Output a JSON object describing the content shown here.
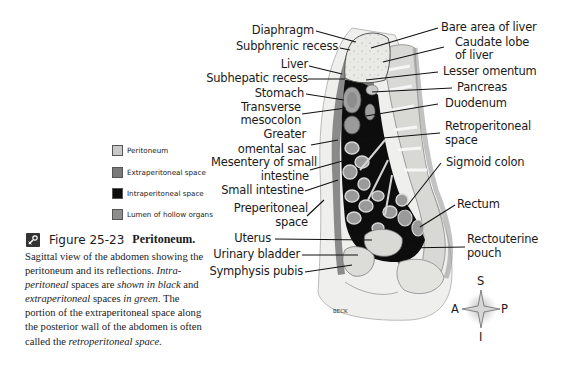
{
  "legend": {
    "items": [
      {
        "label": "Peritoneum",
        "color": "#c8c8c8"
      },
      {
        "label": "Extraperitoneal space",
        "color": "#7a7a7a"
      },
      {
        "label": "Intraperitoneal space",
        "color": "#0d0d0d"
      },
      {
        "label": "Lumen of hollow organs",
        "color": "#8d8d8d"
      }
    ]
  },
  "figure": {
    "icon": "interactive-link-icon",
    "number": "Figure 25-23",
    "title": "Peritoneum.",
    "caption_parts": [
      {
        "text": "Sagittal view of the abdomen showing the peritoneum and its reflections. ",
        "italic": false
      },
      {
        "text": "Intra-peritoneal",
        "italic": true
      },
      {
        "text": " spaces are ",
        "italic": false
      },
      {
        "text": "shown in black",
        "italic": true
      },
      {
        "text": " and ",
        "italic": false
      },
      {
        "text": "extraperitoneal",
        "italic": true
      },
      {
        "text": " spaces ",
        "italic": false
      },
      {
        "text": "in green.",
        "italic": true
      },
      {
        "text": " The portion of the extraperitoneal space along the posterior wall of the abdomen is often called the ",
        "italic": false
      },
      {
        "text": "retroperitoneal space.",
        "italic": true
      }
    ]
  },
  "labels_left": [
    {
      "text": "Diaphragm"
    },
    {
      "text": "Subphrenic recess"
    },
    {
      "text": "Liver"
    },
    {
      "text": "Subhepatic recess"
    },
    {
      "text": "Stomach"
    },
    {
      "text": "Transverse"
    },
    {
      "text": "mesocolon"
    },
    {
      "text": "Greater"
    },
    {
      "text": "omental sac"
    },
    {
      "text": "Mesentery of small"
    },
    {
      "text": "intestine"
    },
    {
      "text": "Small intestine"
    },
    {
      "text": "Preperitoneal"
    },
    {
      "text": "space"
    },
    {
      "text": "Uterus"
    },
    {
      "text": "Urinary bladder"
    },
    {
      "text": "Symphysis pubis"
    }
  ],
  "labels_right": [
    {
      "text": "Bare area of liver"
    },
    {
      "text": "Caudate lobe"
    },
    {
      "text": "of liver"
    },
    {
      "text": "Lesser omentum"
    },
    {
      "text": "Pancreas"
    },
    {
      "text": "Duodenum"
    },
    {
      "text": "Retroperitoneal"
    },
    {
      "text": "space"
    },
    {
      "text": "Sigmoid colon"
    },
    {
      "text": "Rectum"
    },
    {
      "text": "Rectouterine"
    },
    {
      "text": "pouch"
    }
  ],
  "artist_signature": "BECK",
  "compass": {
    "superior": "S",
    "inferior": "I",
    "anterior": "A",
    "posterior": "P"
  }
}
